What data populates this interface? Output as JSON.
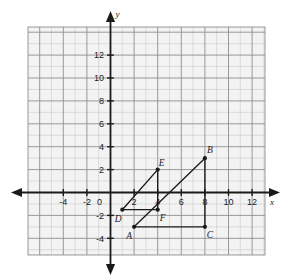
{
  "figure": {
    "title": "",
    "background_color": "#ffffff",
    "plot_background_color": "#f3f3f3",
    "grid_minor_color": "#c9c9c9",
    "grid_major_color": "#8f8f8f",
    "axis_color": "#1a1a1a",
    "ink_color": "#1a1a1a"
  },
  "axes": {
    "x_axis_label": "x",
    "y_axis_label": "y",
    "origin_label": "0",
    "x_tick_labels": [
      "-4",
      "-2",
      "0",
      "2",
      "4",
      "6",
      "8",
      "10",
      "12"
    ],
    "x_tick_values": [
      -4,
      -2,
      0,
      2,
      4,
      6,
      8,
      10,
      12
    ],
    "y_tick_labels": [
      "12",
      "10",
      "8",
      "6",
      "4",
      "2",
      "-2",
      "-4"
    ],
    "y_tick_values": [
      12,
      10,
      8,
      6,
      4,
      2,
      -2,
      -4
    ],
    "xlim": [
      -7,
      13
    ],
    "ylim": [
      -6,
      13
    ],
    "grid_step": 1,
    "tick_step": 2,
    "x_arrow_left": true,
    "x_arrow_right": true,
    "y_arrow_up": true,
    "y_arrow_down": true
  },
  "chart_data": {
    "type": "scatter",
    "title": "",
    "xlabel": "x",
    "ylabel": "y",
    "xlim": [
      -7,
      13
    ],
    "ylim": [
      -6,
      13
    ],
    "grid": true,
    "legend": "none",
    "points": [
      {
        "label": "A",
        "x": 2,
        "y": -3,
        "label_dx": -5,
        "label_dy": 12
      },
      {
        "label": "B",
        "x": 8,
        "y": 3,
        "label_dx": 5,
        "label_dy": -5
      },
      {
        "label": "C",
        "x": 8,
        "y": -3,
        "label_dx": 5,
        "label_dy": 11
      },
      {
        "label": "D",
        "x": 1,
        "y": -1.5,
        "label_dx": -4,
        "label_dy": 12
      },
      {
        "label": "E",
        "x": 4,
        "y": 2,
        "label_dx": 4,
        "label_dy": -4
      },
      {
        "label": "F",
        "x": 4,
        "y": -1.5,
        "label_dx": 5,
        "label_dy": 11
      }
    ],
    "series": [
      {
        "name": "triangle-ABC",
        "closed": true,
        "vertices": [
          [
            2,
            -3
          ],
          [
            8,
            3
          ],
          [
            8,
            -3
          ]
        ]
      },
      {
        "name": "triangle-DEF",
        "closed": true,
        "vertices": [
          [
            1,
            -1.5
          ],
          [
            4,
            2
          ],
          [
            4,
            -1.5
          ]
        ]
      }
    ]
  }
}
